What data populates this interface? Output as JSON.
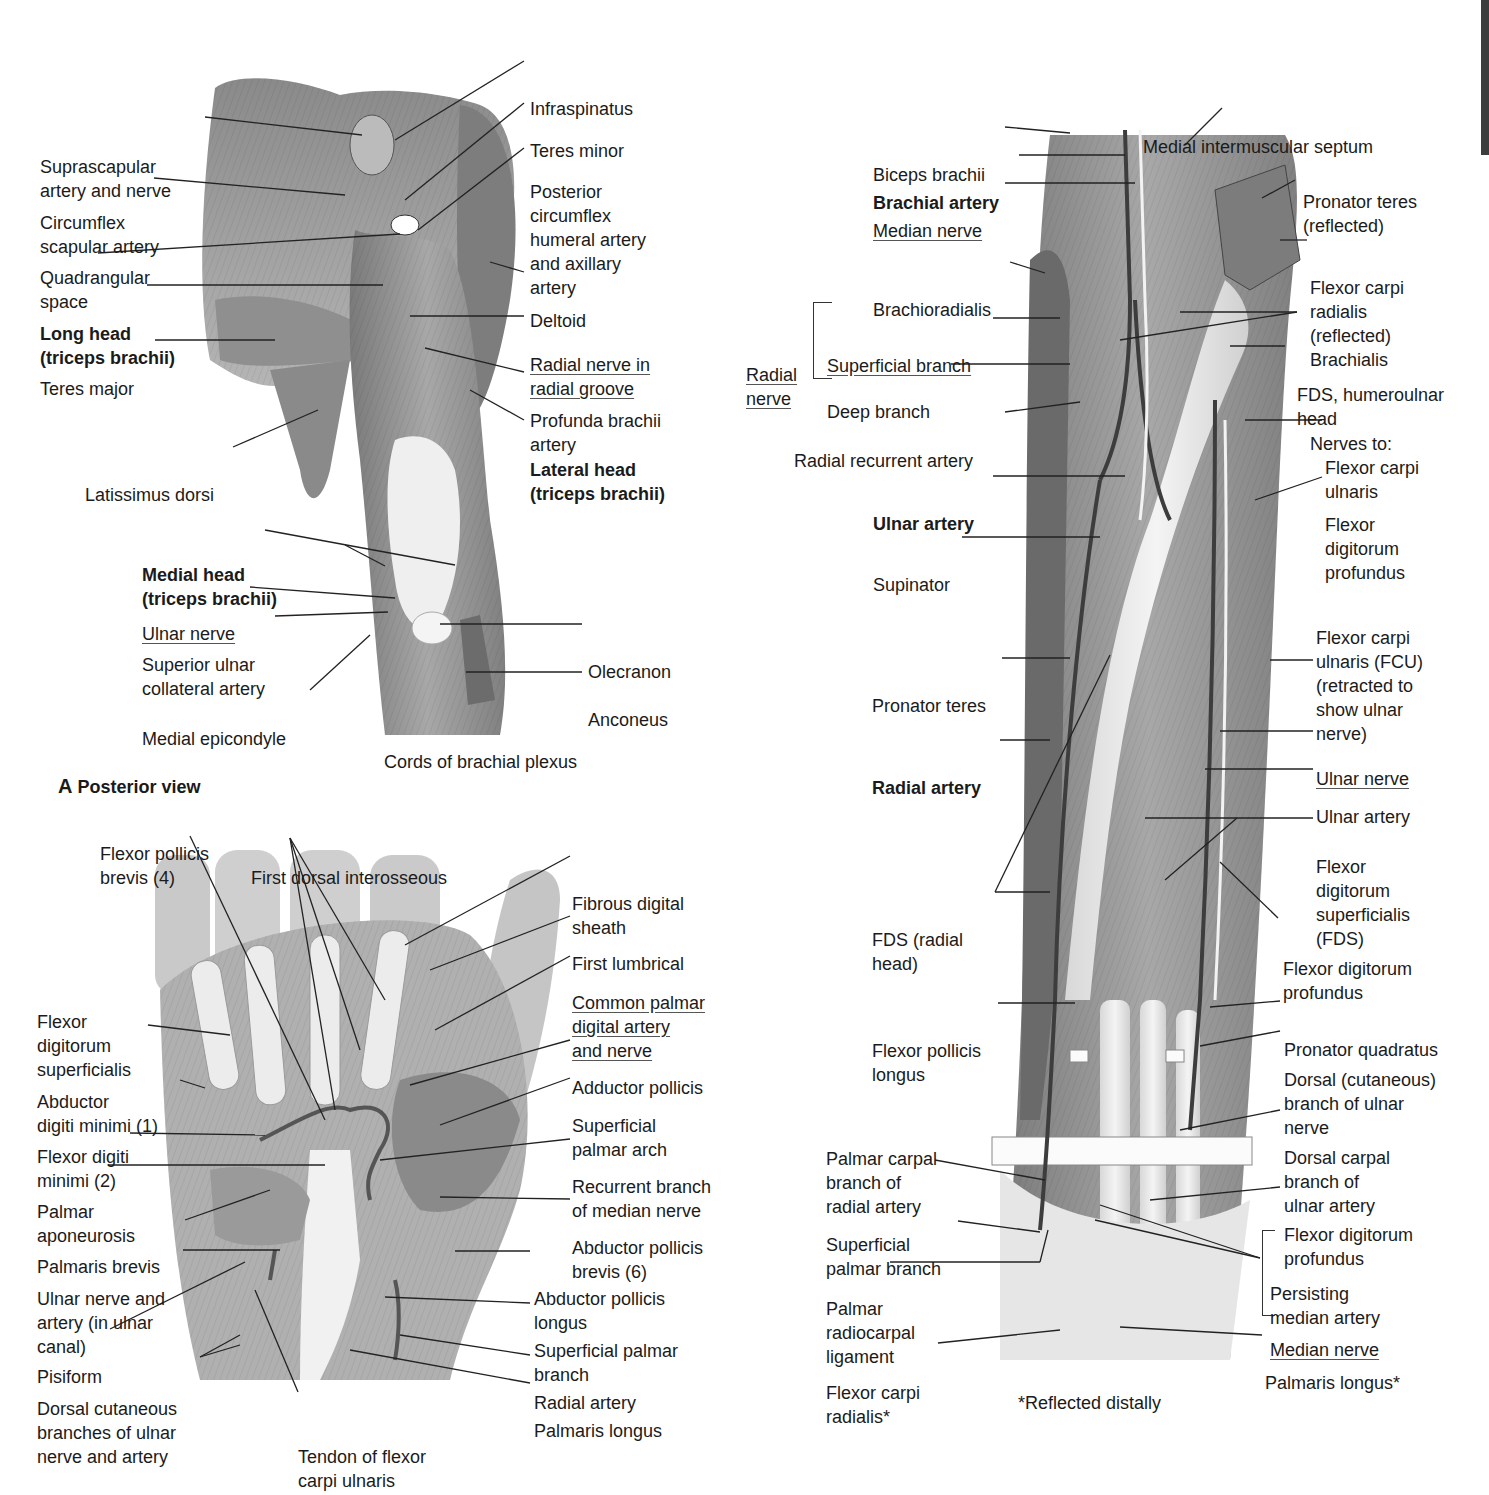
{
  "figure": {
    "panel_a": {
      "caption_letter": "A",
      "caption_text": "Posterior view",
      "subcaption": "Cords of brachial plexus",
      "labels_left": [
        {
          "id": "suprascapular",
          "lines": [
            "Suprascapular",
            "artery and nerve"
          ],
          "bold": false,
          "underline": false
        },
        {
          "id": "circumflex-scapular",
          "lines": [
            "Circumflex",
            "scapular artery"
          ],
          "bold": false,
          "underline": false
        },
        {
          "id": "quadrangular-space",
          "lines": [
            "Quadrangular",
            "space"
          ],
          "bold": false,
          "underline": false
        },
        {
          "id": "long-head",
          "lines": [
            "Long head",
            "(triceps brachii)"
          ],
          "bold": true,
          "underline": false
        },
        {
          "id": "teres-major",
          "lines": [
            "Teres major"
          ],
          "bold": false,
          "underline": false
        },
        {
          "id": "latissimus-dorsi",
          "lines": [
            "Latissimus dorsi"
          ],
          "bold": false,
          "underline": false
        },
        {
          "id": "medial-head",
          "lines": [
            "Medial head",
            "(triceps brachii)"
          ],
          "bold": true,
          "underline": false
        },
        {
          "id": "ulnar-nerve",
          "lines": [
            "Ulnar nerve"
          ],
          "bold": false,
          "underline": true
        },
        {
          "id": "superior-ulnar-collateral",
          "lines": [
            "Superior ulnar",
            "collateral artery"
          ],
          "bold": false,
          "underline": false
        },
        {
          "id": "medial-epicondyle",
          "lines": [
            "Medial epicondyle"
          ],
          "bold": false,
          "underline": false
        }
      ],
      "labels_right": [
        {
          "id": "infraspinatus",
          "lines": [
            "Infraspinatus"
          ],
          "bold": false,
          "underline": false
        },
        {
          "id": "teres-minor",
          "lines": [
            "Teres minor"
          ],
          "bold": false,
          "underline": false
        },
        {
          "id": "posterior-circumflex",
          "lines": [
            "Posterior",
            "circumflex",
            "humeral artery",
            "and axillary",
            "artery"
          ],
          "bold": false,
          "underline": false
        },
        {
          "id": "deltoid",
          "lines": [
            "Deltoid"
          ],
          "bold": false,
          "underline": false
        },
        {
          "id": "radial-nerve-groove",
          "lines": [
            "Radial nerve in",
            "radial groove"
          ],
          "bold": false,
          "underline": true
        },
        {
          "id": "profunda-brachii",
          "lines": [
            "Profunda brachii",
            "artery"
          ],
          "bold": false,
          "underline": false
        },
        {
          "id": "lateral-head",
          "lines": [
            "Lateral head",
            "(triceps brachii)"
          ],
          "bold": true,
          "underline": false
        },
        {
          "id": "olecranon",
          "lines": [
            "Olecranon"
          ],
          "bold": false,
          "underline": false
        },
        {
          "id": "anconeus",
          "lines": [
            "Anconeus"
          ],
          "bold": false,
          "underline": false
        }
      ]
    },
    "panel_hand": {
      "labels_left": [
        {
          "id": "flexor-pollicis-brevis",
          "lines": [
            "Flexor pollicis",
            "brevis (4)"
          ],
          "bold": false,
          "underline": false
        },
        {
          "id": "first-dorsal-interosseous",
          "lines": [
            "First dorsal interosseous"
          ],
          "bold": false,
          "underline": false
        },
        {
          "id": "fds-hand",
          "lines": [
            "Flexor",
            "digitorum",
            "superficialis"
          ],
          "bold": false,
          "underline": false
        },
        {
          "id": "abductor-digiti-minimi",
          "lines": [
            "Abductor",
            "digiti minimi (1)"
          ],
          "bold": false,
          "underline": false
        },
        {
          "id": "flexor-digiti-minimi",
          "lines": [
            "Flexor digiti",
            "minimi (2)"
          ],
          "bold": false,
          "underline": false
        },
        {
          "id": "palmar-aponeurosis",
          "lines": [
            "Palmar",
            "aponeurosis"
          ],
          "bold": false,
          "underline": false
        },
        {
          "id": "palmaris-brevis",
          "lines": [
            "Palmaris brevis"
          ],
          "bold": false,
          "underline": false
        },
        {
          "id": "ulnar-nerve-artery-canal",
          "lines": [
            "Ulnar nerve and",
            "artery (in ulnar",
            "canal)"
          ],
          "bold": false,
          "underline": false
        },
        {
          "id": "pisiform",
          "lines": [
            "Pisiform"
          ],
          "bold": false,
          "underline": false
        },
        {
          "id": "dorsal-cutaneous-branches",
          "lines": [
            "Dorsal cutaneous",
            "branches of ulnar",
            "nerve and artery"
          ],
          "bold": false,
          "underline": false
        },
        {
          "id": "tendon-fcu",
          "lines": [
            "Tendon of flexor",
            "carpi ulnaris"
          ],
          "bold": false,
          "underline": false
        }
      ],
      "labels_right": [
        {
          "id": "fibrous-digital-sheath",
          "lines": [
            "Fibrous digital",
            "sheath"
          ],
          "bold": false,
          "underline": false
        },
        {
          "id": "first-lumbrical",
          "lines": [
            "First lumbrical"
          ],
          "bold": false,
          "underline": false
        },
        {
          "id": "common-palmar-digital",
          "lines": [
            "Common palmar",
            "digital artery",
            "and nerve"
          ],
          "bold": false,
          "underline": true
        },
        {
          "id": "adductor-pollicis",
          "lines": [
            "Adductor pollicis"
          ],
          "bold": false,
          "underline": false
        },
        {
          "id": "superficial-palmar-arch",
          "lines": [
            "Superficial",
            "palmar arch"
          ],
          "bold": false,
          "underline": false
        },
        {
          "id": "recurrent-branch-median",
          "lines": [
            "Recurrent branch",
            "of median nerve"
          ],
          "bold": false,
          "underline": false
        },
        {
          "id": "abductor-pollicis-brevis",
          "lines": [
            "Abductor pollicis",
            "brevis (6)"
          ],
          "bold": false,
          "underline": false
        },
        {
          "id": "abductor-pollicis-longus",
          "lines": [
            "Abductor pollicis",
            "longus"
          ],
          "bold": false,
          "underline": false
        },
        {
          "id": "superficial-palmar-branch-hand",
          "lines": [
            "Superficial palmar",
            "branch"
          ],
          "bold": false,
          "underline": false
        },
        {
          "id": "radial-artery-hand",
          "lines": [
            "Radial artery"
          ],
          "bold": false,
          "underline": false
        },
        {
          "id": "palmaris-longus-hand",
          "lines": [
            "Palmaris longus"
          ],
          "bold": false,
          "underline": false
        }
      ]
    },
    "panel_forearm": {
      "footnote": "*Reflected distally",
      "radial_nerve_group": {
        "label_lines": [
          "Radial",
          "nerve"
        ],
        "underline": true
      },
      "labels_left": [
        {
          "id": "biceps-brachii",
          "lines": [
            "Biceps brachii"
          ],
          "bold": false,
          "underline": false
        },
        {
          "id": "brachial-artery",
          "lines": [
            "Brachial artery"
          ],
          "bold": true,
          "underline": false
        },
        {
          "id": "median-nerve-top",
          "lines": [
            "Median nerve"
          ],
          "bold": false,
          "underline": true
        },
        {
          "id": "brachioradialis",
          "lines": [
            "Brachioradialis"
          ],
          "bold": false,
          "underline": false
        },
        {
          "id": "superficial-branch",
          "lines": [
            "Superficial branch"
          ],
          "bold": false,
          "underline": true
        },
        {
          "id": "deep-branch",
          "lines": [
            "Deep branch"
          ],
          "bold": false,
          "underline": false
        },
        {
          "id": "radial-recurrent-artery",
          "lines": [
            "Radial recurrent artery"
          ],
          "bold": false,
          "underline": false
        },
        {
          "id": "ulnar-artery-top",
          "lines": [
            "Ulnar artery"
          ],
          "bold": true,
          "underline": false
        },
        {
          "id": "supinator",
          "lines": [
            "Supinator"
          ],
          "bold": false,
          "underline": false
        },
        {
          "id": "pronator-teres",
          "lines": [
            "Pronator teres"
          ],
          "bold": false,
          "underline": false
        },
        {
          "id": "radial-artery",
          "lines": [
            "Radial artery"
          ],
          "bold": true,
          "underline": false
        },
        {
          "id": "fds-radial-head",
          "lines": [
            "FDS (radial",
            "head)"
          ],
          "bold": false,
          "underline": false
        },
        {
          "id": "flexor-pollicis-longus",
          "lines": [
            "Flexor pollicis",
            "longus"
          ],
          "bold": false,
          "underline": false
        },
        {
          "id": "palmar-carpal-branch",
          "lines": [
            "Palmar carpal",
            "branch of",
            "radial artery"
          ],
          "bold": false,
          "underline": false
        },
        {
          "id": "superficial-palmar-branch",
          "lines": [
            "Superficial",
            "palmar branch"
          ],
          "bold": false,
          "underline": false
        },
        {
          "id": "palmar-radiocarpal-ligament",
          "lines": [
            "Palmar",
            "radiocarpal",
            "ligament"
          ],
          "bold": false,
          "underline": false
        },
        {
          "id": "flexor-carpi-radialis-star",
          "lines": [
            "Flexor carpi",
            "radialis*"
          ],
          "bold": false,
          "underline": false
        }
      ],
      "labels_right": [
        {
          "id": "medial-intermuscular-septum",
          "lines": [
            "Medial intermuscular septum"
          ],
          "bold": false,
          "underline": false
        },
        {
          "id": "pronator-teres-reflected",
          "lines": [
            "Pronator teres",
            "(reflected)"
          ],
          "bold": false,
          "underline": false
        },
        {
          "id": "fcr-reflected",
          "lines": [
            "Flexor carpi",
            "radialis",
            "(reflected)"
          ],
          "bold": false,
          "underline": false
        },
        {
          "id": "brachialis",
          "lines": [
            "Brachialis"
          ],
          "bold": false,
          "underline": false
        },
        {
          "id": "fds-humeroulnar",
          "lines": [
            "FDS, humeroulnar",
            "head"
          ],
          "bold": false,
          "underline": false
        },
        {
          "id": "nerves-to",
          "lines": [
            "Nerves to:"
          ],
          "bold": false,
          "underline": false
        },
        {
          "id": "nerve-fcu",
          "lines": [
            "Flexor carpi",
            "ulnaris"
          ],
          "bold": false,
          "underline": false
        },
        {
          "id": "nerve-fdp",
          "lines": [
            "Flexor",
            "digitorum",
            "profundus"
          ],
          "bold": false,
          "underline": false
        },
        {
          "id": "fcu-retracted",
          "lines": [
            "Flexor carpi",
            "ulnaris (FCU)",
            "(retracted to",
            "show ulnar",
            "nerve)"
          ],
          "bold": false,
          "underline": false
        },
        {
          "id": "ulnar-nerve-forearm",
          "lines": [
            "Ulnar nerve"
          ],
          "bold": false,
          "underline": true
        },
        {
          "id": "ulnar-artery-forearm",
          "lines": [
            "Ulnar artery"
          ],
          "bold": false,
          "underline": false
        },
        {
          "id": "fds-forearm",
          "lines": [
            "Flexor",
            "digitorum",
            "superficialis",
            "(FDS)"
          ],
          "bold": false,
          "underline": false
        },
        {
          "id": "fdp-mid",
          "lines": [
            "Flexor digitorum",
            "profundus"
          ],
          "bold": false,
          "underline": false
        },
        {
          "id": "pronator-quadratus",
          "lines": [
            "Pronator quadratus"
          ],
          "bold": false,
          "underline": false
        },
        {
          "id": "dorsal-cutaneous-ulnar",
          "lines": [
            "Dorsal (cutaneous)",
            "branch of ulnar",
            "nerve"
          ],
          "bold": false,
          "underline": false
        },
        {
          "id": "dorsal-carpal-branch",
          "lines": [
            "Dorsal carpal",
            "branch of",
            "ulnar artery"
          ],
          "bold": false,
          "underline": false
        },
        {
          "id": "fdp-low",
          "lines": [
            "Flexor digitorum",
            "profundus"
          ],
          "bold": false,
          "underline": false
        },
        {
          "id": "persisting-median-artery",
          "lines": [
            "Persisting",
            "median artery"
          ],
          "bold": false,
          "underline": false
        },
        {
          "id": "median-nerve-low",
          "lines": [
            "Median nerve"
          ],
          "bold": false,
          "underline": true
        },
        {
          "id": "palmaris-longus-star",
          "lines": [
            "Palmaris longus*"
          ],
          "bold": false,
          "underline": false
        }
      ]
    }
  },
  "colors": {
    "muscle_dark": "#6e6e6e",
    "muscle_mid": "#9a9a9a",
    "muscle_light": "#c8c8c8",
    "tendon": "#ececec",
    "leader_line": "#222222",
    "text": "#1b1b1b",
    "edge_tab": "#3d3d3d"
  }
}
